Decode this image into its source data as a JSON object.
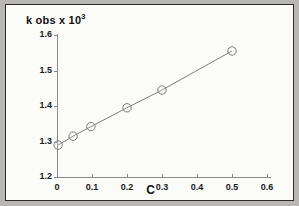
{
  "figure": {
    "frame_color": "#2b2b2b",
    "background_color": "#fbfbfa",
    "page_color": "#b9b7b4"
  },
  "chart_data": {
    "type": "scatter",
    "title": "",
    "subtitle": "",
    "ylabel": "k obs x 10",
    "ylabel_exponent": "3",
    "xlabel": "C",
    "xlim": [
      0,
      0.6
    ],
    "ylim": [
      1.2,
      1.6
    ],
    "xticks": [
      "0",
      "0.1",
      "0.2",
      "0.3",
      "0.4",
      "0.5",
      "0.6"
    ],
    "xtick_values": [
      0,
      0.1,
      0.2,
      0.3,
      0.4,
      0.5,
      0.6
    ],
    "yticks": [
      "1.2",
      "1.3",
      "1.4",
      "1.5",
      "1.6"
    ],
    "ytick_values": [
      1.2,
      1.3,
      1.4,
      1.5,
      1.6
    ],
    "grid": false,
    "legend": null,
    "marker": "open-circle",
    "line_color": "#6e6e6e",
    "marker_color": "#6e6e6e",
    "x": [
      0.003,
      0.046,
      0.097,
      0.2,
      0.3,
      0.5
    ],
    "y": [
      1.29,
      1.315,
      1.342,
      1.395,
      1.445,
      1.555
    ],
    "series": [
      {
        "name": "k obs vs C",
        "points": [
          {
            "x": 0.003,
            "y": 1.29
          },
          {
            "x": 0.046,
            "y": 1.315
          },
          {
            "x": 0.097,
            "y": 1.342
          },
          {
            "x": 0.2,
            "y": 1.395
          },
          {
            "x": 0.3,
            "y": 1.445
          },
          {
            "x": 0.5,
            "y": 1.555
          }
        ]
      }
    ],
    "annotations": []
  }
}
